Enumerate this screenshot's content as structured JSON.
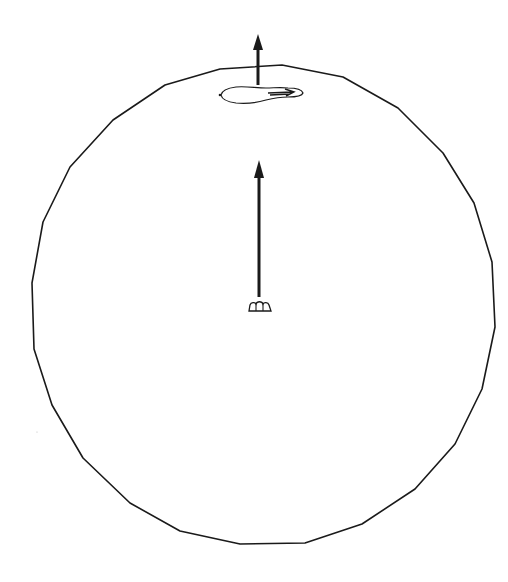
{
  "diagram": {
    "background": "#ffffff",
    "stroke_color": "#1a1a1a",
    "outline": {
      "shape": "polygon",
      "points": [
        [
          220,
          69
        ],
        [
          282,
          65
        ],
        [
          343,
          77
        ],
        [
          398,
          108
        ],
        [
          443,
          153
        ],
        [
          474,
          203
        ],
        [
          492,
          262
        ],
        [
          495,
          327
        ],
        [
          482,
          389
        ],
        [
          455,
          444
        ],
        [
          415,
          489
        ],
        [
          362,
          524
        ],
        [
          305,
          543
        ],
        [
          240,
          544
        ],
        [
          180,
          531
        ],
        [
          130,
          503
        ],
        [
          83,
          458
        ],
        [
          52,
          405
        ],
        [
          34,
          349
        ],
        [
          32,
          283
        ],
        [
          43,
          222
        ],
        [
          70,
          167
        ],
        [
          113,
          120
        ],
        [
          165,
          85
        ]
      ]
    },
    "top_arrow": {
      "x": 258,
      "y_tail": 85,
      "y_head": 34,
      "direction": "up"
    },
    "center_arrow": {
      "x": 259,
      "y_tail": 297,
      "y_head": 160,
      "direction": "up"
    },
    "blob": {
      "label": "",
      "cx": 262,
      "cy": 94
    },
    "origin_marker": {
      "cx": 260,
      "cy": 306
    }
  }
}
